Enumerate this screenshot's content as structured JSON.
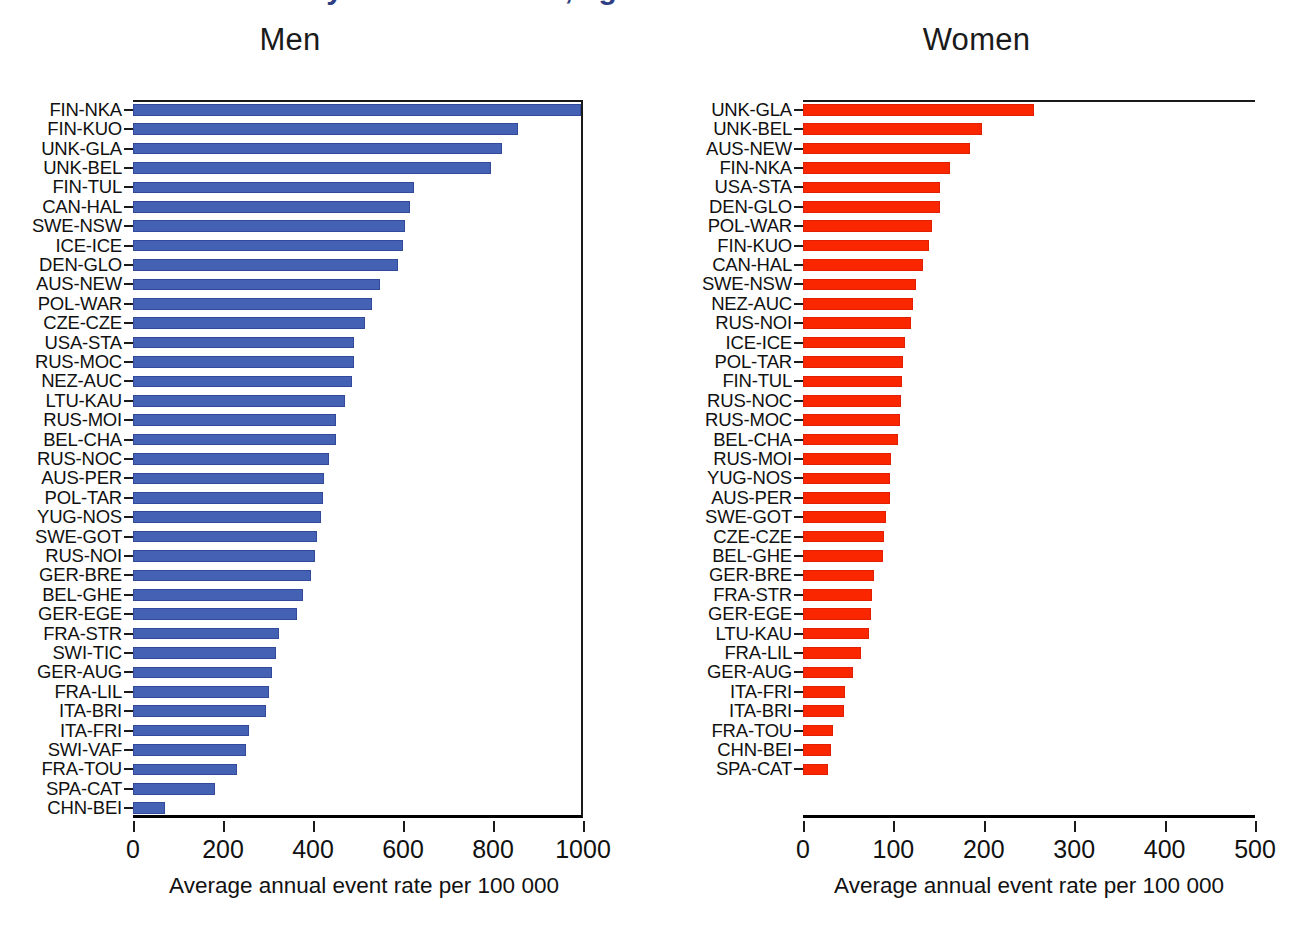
{
  "figure": {
    "cut_off_title": "Incidence of stroke by centre and sex, ages 35-64",
    "xlabel": "Average annual event rate per 100 000",
    "colors": {
      "men_bar": "#4461b4",
      "women_bar": "#fa2600",
      "text": "#111111"
    }
  },
  "chart_data": [
    {
      "type": "bar",
      "orientation": "horizontal",
      "title": "Men",
      "xlabel": "Average annual event rate per 100 000",
      "ylabel": "",
      "xlim": [
        0,
        1000
      ],
      "xticks": [
        0,
        200,
        400,
        600,
        800,
        1000
      ],
      "grid": false,
      "legend": "none",
      "color": "#4461b4",
      "categories": [
        "FIN-NKA",
        "FIN-KUO",
        "UNK-GLA",
        "UNK-BEL",
        "FIN-TUL",
        "CAN-HAL",
        "SWE-NSW",
        "ICE-ICE",
        "DEN-GLO",
        "AUS-NEW",
        "POL-WAR",
        "CZE-CZE",
        "USA-STA",
        "RUS-MOC",
        "NEZ-AUC",
        "LTU-KAU",
        "RUS-MOI",
        "BEL-CHA",
        "RUS-NOC",
        "AUS-PER",
        "POL-TAR",
        "YUG-NOS",
        "SWE-GOT",
        "RUS-NOI",
        "GER-BRE",
        "BEL-GHE",
        "GER-EGE",
        "FRA-STR",
        "SWI-TIC",
        "GER-AUG",
        "FRA-LIL",
        "ITA-BRI",
        "ITA-FRI",
        "SWI-VAF",
        "FRA-TOU",
        "SPA-CAT",
        "CHN-BEI"
      ],
      "values": [
        995,
        855,
        820,
        795,
        625,
        615,
        605,
        600,
        588,
        548,
        532,
        515,
        492,
        490,
        487,
        470,
        452,
        450,
        435,
        425,
        423,
        418,
        408,
        405,
        395,
        378,
        365,
        325,
        318,
        308,
        303,
        295,
        258,
        252,
        232,
        182,
        70
      ]
    },
    {
      "type": "bar",
      "orientation": "horizontal",
      "title": "Women",
      "xlabel": "Average annual event rate per 100 000",
      "ylabel": "",
      "xlim": [
        0,
        500
      ],
      "xticks": [
        0,
        100,
        200,
        300,
        400,
        500
      ],
      "grid": false,
      "legend": "none",
      "color": "#fa2600",
      "categories": [
        "UNK-GLA",
        "UNK-BEL",
        "AUS-NEW",
        "FIN-NKA",
        "USA-STA",
        "DEN-GLO",
        "POL-WAR",
        "FIN-KUO",
        "CAN-HAL",
        "SWE-NSW",
        "NEZ-AUC",
        "RUS-NOI",
        "ICE-ICE",
        "POL-TAR",
        "FIN-TUL",
        "RUS-NOC",
        "RUS-MOC",
        "BEL-CHA",
        "RUS-MOI",
        "YUG-NOS",
        "AUS-PER",
        "SWE-GOT",
        "CZE-CZE",
        "BEL-GHE",
        "GER-BRE",
        "FRA-STR",
        "GER-EGE",
        "LTU-KAU",
        "FRA-LIL",
        "GER-AUG",
        "ITA-FRI",
        "ITA-BRI",
        "FRA-TOU",
        "CHN-BEI",
        "SPA-CAT"
      ],
      "values": [
        255,
        198,
        185,
        163,
        152,
        152,
        143,
        139,
        133,
        125,
        122,
        120,
        113,
        111,
        110,
        108,
        107,
        105,
        97,
        96,
        96,
        92,
        90,
        88,
        78,
        76,
        75,
        73,
        64,
        55,
        47,
        45,
        33,
        31,
        28
      ]
    }
  ]
}
